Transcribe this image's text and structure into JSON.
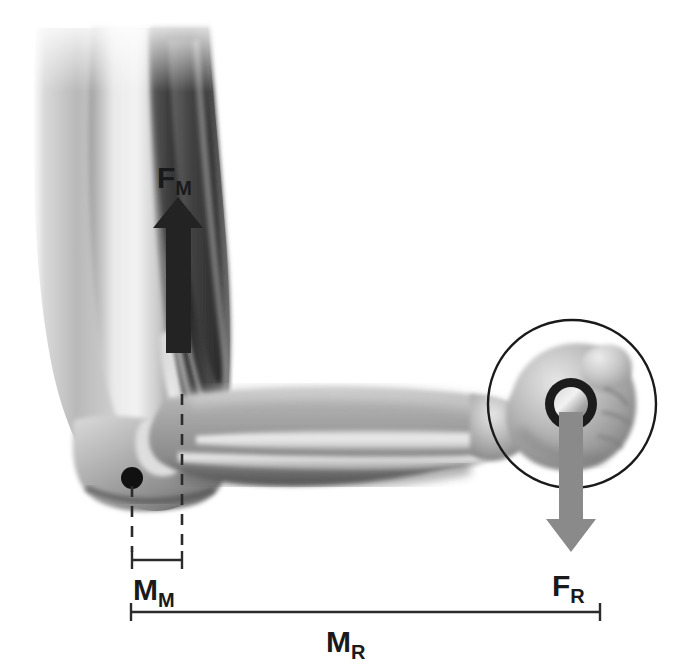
{
  "figure": {
    "background_color": "#ffffff"
  },
  "labels": {
    "muscle_force": {
      "base": "F",
      "subscript": "M",
      "full": "FM"
    },
    "resistance_force": {
      "base": "F",
      "subscript": "R",
      "full": "FR"
    },
    "muscle_moment_arm": {
      "base": "M",
      "subscript": "M",
      "full": "MM"
    },
    "resistance_moment_arm": {
      "base": "M",
      "subscript": "R",
      "full": "MR"
    }
  },
  "colors": {
    "muscle_force_arrow": "#232323",
    "resistance_force_arrow": "#8a8a8a",
    "fulcrum_dot": "#111111",
    "label_text": "#1a1a1a",
    "leader_line": "#2b2b2b",
    "dimension_line": "#2b2b2b",
    "grip_ring": "#1c1c1c",
    "circle_outline": "#1a1a1a",
    "skin_light": "#e9e9e9",
    "skin_mid": "#b4b4b4",
    "skin_dark": "#6e6e6e",
    "muscle_dark": "#3c3c3c",
    "bone_light": "#e4e4e4"
  },
  "anatomy": {
    "upper_arm": "humerus with biceps brachii",
    "forearm": "radius and ulna",
    "hand": "closed fist gripping a barbell",
    "joint": "elbow (fulcrum)"
  },
  "annotations": {
    "fulcrum": {
      "name": "elbow-joint-fulcrum",
      "cx": 132,
      "cy": 478,
      "r": 11
    },
    "muscle_force_arrow": {
      "x": 178,
      "y_tail": 352,
      "y_tip": 197,
      "direction": "up"
    },
    "resistance_force_arrow": {
      "x": 571,
      "y_tail": 412,
      "y_tip": 552,
      "direction": "down"
    },
    "weight_circle": {
      "cx": 572,
      "cy": 404,
      "r": 84
    },
    "grip_ring": {
      "cx": 571,
      "cy": 404,
      "r_outer": 26,
      "r_inner": 17
    },
    "dim_mm": {
      "x1": 132,
      "x2": 182,
      "y": 560
    },
    "dim_mr": {
      "x1": 131,
      "x2": 600,
      "y": 612
    },
    "dashed_left": {
      "x": 132,
      "y1": 488,
      "y2": 552
    },
    "dashed_right": {
      "x": 182,
      "y1": 394,
      "y2": 552
    }
  }
}
